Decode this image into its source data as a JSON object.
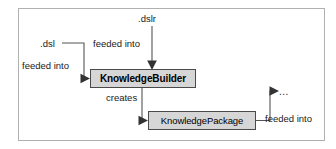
{
  "diagram": {
    "frame": {
      "border_color": "#aaaaaa",
      "background": "#ffffff"
    },
    "nodes": [
      {
        "id": "knowledgebuilder",
        "label": "KnowledgeBuilder",
        "bold": true,
        "fill": "#d6d6d6",
        "stroke": "#4a4a4a"
      },
      {
        "id": "knowledgepackage",
        "label": "KnowledgePackage",
        "bold": false,
        "fill": "#d6d6d6",
        "stroke": "#4a4a4a"
      }
    ],
    "sources": [
      {
        "id": "dslr",
        "label": ".dslr"
      },
      {
        "id": "dsl",
        "label": ".dsl"
      },
      {
        "id": "ellipsis",
        "label": "..."
      }
    ],
    "edges": [
      {
        "id": "dslr-to-builder",
        "label": "feeded into",
        "from": ".dslr",
        "to": "KnowledgeBuilder"
      },
      {
        "id": "dsl-to-builder",
        "label": "feeded into",
        "from": ".dsl",
        "to": "KnowledgeBuilder"
      },
      {
        "id": "builder-to-package",
        "label": "creates",
        "from": "KnowledgeBuilder",
        "to": "KnowledgePackage"
      },
      {
        "id": "package-to-ellipsis",
        "label": "feeded into",
        "from": "KnowledgePackage",
        "to": "..."
      }
    ],
    "line_color": "#555555",
    "text_color": "#1a1a1a"
  }
}
